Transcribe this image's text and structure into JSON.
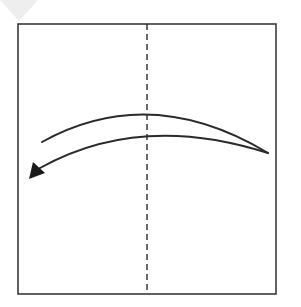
{
  "diagram": {
    "type": "origami-fold-instruction",
    "canvas": {
      "width": 301,
      "height": 307,
      "background": "#ffffff"
    },
    "corner_marker": {
      "shape": "triangle",
      "points": "0,0 38,0 19,21",
      "color": "#eeeeee"
    },
    "paper": {
      "shape": "square",
      "x": 18,
      "y": 24,
      "width": 258,
      "height": 270,
      "stroke": "#3a3a3a",
      "stroke_width": 1.6
    },
    "fold_line": {
      "style": "valley-fold-dashed",
      "x": 147,
      "y1": 24,
      "y2": 294,
      "stroke": "#2a2a2a",
      "dash": "6,4"
    },
    "fold_arrow": {
      "direction": "right-to-left",
      "meaning": "fold right half over to the left along center line",
      "stroke": "#2a2a2a",
      "outer_curve": "M 42 142 Q 150 82 268 153",
      "inner_curve": "M 268 153 Q 140 112 40 168",
      "arrowhead": "29,179 33,162 45,173",
      "color": "#1a1a1a"
    }
  }
}
